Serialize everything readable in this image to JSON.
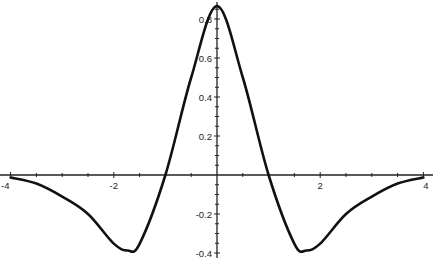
{
  "chart_data": {
    "type": "line",
    "title": "",
    "xlabel": "",
    "ylabel": "",
    "xlim": [
      -4,
      4
    ],
    "ylim": [
      -0.4,
      0.87
    ],
    "grid": false,
    "legend": null,
    "x_ticks": [
      "-4",
      "-2",
      "2",
      "4"
    ],
    "y_ticks": [
      "0.8",
      "0.6",
      "0.4",
      "0.2",
      "-0.2",
      "-0.4"
    ],
    "series": [
      {
        "name": "curve",
        "color": "#111111",
        "x": [
          -4,
          -3.5,
          -3,
          -2.5,
          -2,
          -1.732,
          -1.5,
          -1,
          -0.5,
          0,
          0.5,
          1,
          1.5,
          1.732,
          2,
          2.5,
          3,
          3.5,
          4
        ],
        "y": [
          -0.013,
          -0.044,
          -0.111,
          -0.2,
          -0.352,
          -0.387,
          -0.353,
          0.0,
          0.5,
          0.867,
          0.5,
          0.0,
          -0.353,
          -0.387,
          -0.352,
          -0.2,
          -0.111,
          -0.044,
          -0.013
        ]
      }
    ]
  }
}
